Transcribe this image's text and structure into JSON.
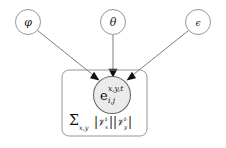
{
  "figure": {
    "type": "plate-notation-graphical-model",
    "background_color": "#ffffff",
    "stroke_color": "#8a8a8a",
    "node_fill_color": "#ebebeb",
    "text_color": "#222222"
  },
  "nodes": {
    "phi": {
      "label": "φ",
      "name": "phi",
      "cx": 28,
      "cy": 22,
      "r": 12.5
    },
    "theta": {
      "label": "θ",
      "name": "theta",
      "cx": 113,
      "cy": 22,
      "r": 12.5
    },
    "epsilon": {
      "label": "ϵ",
      "name": "epsilon",
      "cx": 198,
      "cy": 22,
      "r": 12.5
    },
    "center": {
      "base": "e",
      "superscript": "x,y,t",
      "subscript": "i,j",
      "name": "e-i-j-x-y-t",
      "cx": 112,
      "cy": 95,
      "r": 18.5
    }
  },
  "plate": {
    "x": 62,
    "y": 70,
    "width": 85,
    "height": 66,
    "rx": 7,
    "label": {
      "sum_symbol": "Σ",
      "sum_subscript": "x,y",
      "term_1": "|𝒱ₓᵗ|",
      "term_2": "|𝒱ᵧᵗ|",
      "cardinality_symbol": "𝒱",
      "cardinality_sub_1": "x",
      "cardinality_sub_2": "y",
      "cardinality_sup": "t",
      "full_text": "Σx,y |𝒱x^t||𝒱y^t|"
    }
  },
  "edges": [
    {
      "name": "edge-phi-to-center",
      "from": "phi",
      "to": "center",
      "has_arrowhead": true
    },
    {
      "name": "edge-theta-to-center",
      "from": "theta",
      "to": "center",
      "has_arrowhead": true
    },
    {
      "name": "edge-epsilon-to-center",
      "from": "epsilon",
      "to": "center",
      "has_arrowhead": true
    }
  ]
}
